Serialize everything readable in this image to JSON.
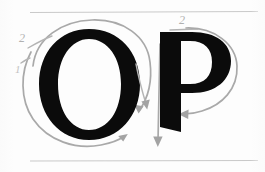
{
  "figure": {
    "kind": "calligraphy-stroke-order-diagram",
    "background_color": "#fdfdfd",
    "ink_color": "#0b0b0b",
    "guide_color": "#a9a9a9",
    "rule_color": "#c9c9c9",
    "letters": [
      {
        "id": "letter-o",
        "character": "O",
        "strokes": [
          {
            "number": "1",
            "label_x": 17,
            "label_y": 72,
            "direction": "counter-clockwise-left-arc"
          },
          {
            "number": "2",
            "label_x": 22,
            "label_y": 42,
            "direction": "clockwise-outer-arc"
          }
        ]
      },
      {
        "id": "letter-p",
        "character": "P",
        "strokes": [
          {
            "number": "1",
            "label_x": 150,
            "label_y": 60,
            "direction": "downward-stem"
          },
          {
            "number": "2",
            "label_x": 180,
            "label_y": 22,
            "direction": "clockwise-bowl"
          }
        ]
      }
    ],
    "ruling_lines": [
      {
        "id": "top-rule",
        "y": 12,
        "x1": 30,
        "x2": 258
      },
      {
        "id": "bottom-rule",
        "y": 161,
        "x1": 30,
        "x2": 258
      }
    ],
    "stroke_numbers": {
      "o_first": "1",
      "o_second": "2",
      "p_first": "1",
      "p_second": "2"
    }
  }
}
